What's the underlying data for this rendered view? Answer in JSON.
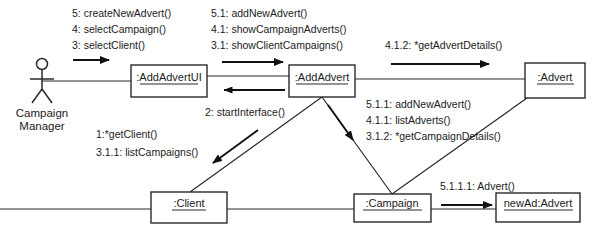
{
  "diagram": {
    "actors": [
      {
        "id": "campaign-manager",
        "name_line1": "Campaign",
        "name_line2": "Manager"
      }
    ],
    "objects": [
      {
        "id": "addadvertui",
        "label": ":AddAdvertUI"
      },
      {
        "id": "addadvert",
        "label": ":AddAdvert"
      },
      {
        "id": "advert",
        "label": ":Advert"
      },
      {
        "id": "client",
        "label": ":Client"
      },
      {
        "id": "campaign",
        "label": ":Campaign"
      },
      {
        "id": "newad",
        "label": "newAd:Advert"
      }
    ],
    "message_groups": [
      {
        "id": "actor-to-ui",
        "lines": [
          "5: createNewAdvert()",
          "4: selectCampaign()",
          "3: selectClient()"
        ]
      },
      {
        "id": "ui-to-addadvert",
        "lines": [
          "5.1: addNewAdvert()",
          "4.1: showCampaignAdverts()",
          "3.1: showClientCampaigns()"
        ]
      },
      {
        "id": "addadvert-to-advert",
        "lines": [
          "4.1.2: *getAdvertDetails()"
        ]
      },
      {
        "id": "addadvert-to-campaign",
        "lines": [
          "5.1.1: addNewAdvert()",
          "4.1.1: listAdverts()",
          "3.1.2: *getCampaignDetails()"
        ]
      },
      {
        "id": "addadvert-to-ui-return",
        "lines": [
          "2: startInterface()"
        ]
      },
      {
        "id": "addadvert-to-client",
        "lines": [
          "1:*getClient()",
          "3.1.1: listCampaigns()"
        ]
      },
      {
        "id": "campaign-to-newad",
        "lines": [
          "5.1.1.1: Advert()"
        ]
      }
    ],
    "colors": {
      "stroke": "#2a2a2a",
      "text": "#1b1b1b",
      "background": "#ffffff"
    }
  }
}
